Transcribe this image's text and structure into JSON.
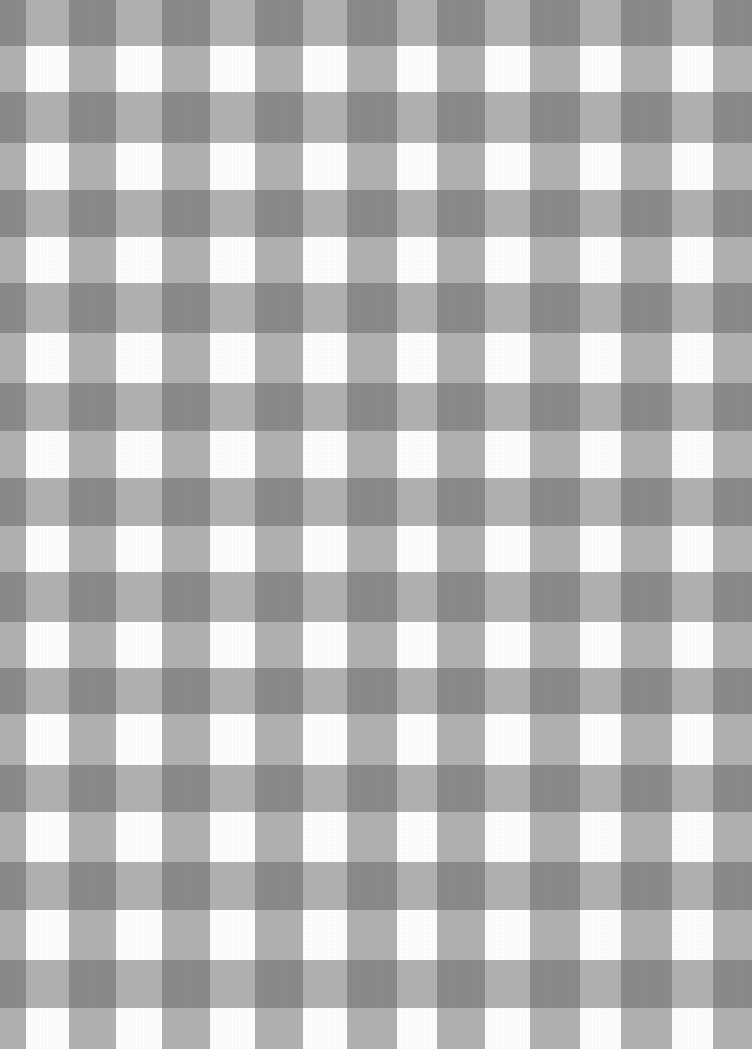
{
  "image": {
    "subject": "Gray watercolor gingham check pattern",
    "width": 752,
    "height": 1049,
    "colors": {
      "background_white": "#fdfdfd",
      "band_tint": "#b3b3b3",
      "intersection": "#8a8a8a"
    },
    "vertical_bands": [
      {
        "x": 0,
        "w": 26
      },
      {
        "x": 69,
        "w": 47
      },
      {
        "x": 162,
        "w": 48
      },
      {
        "x": 255,
        "w": 48
      },
      {
        "x": 347,
        "w": 50
      },
      {
        "x": 437,
        "w": 48
      },
      {
        "x": 530,
        "w": 50
      },
      {
        "x": 621,
        "w": 51
      },
      {
        "x": 713,
        "w": 39
      }
    ],
    "horizontal_bands": [
      {
        "y": 0,
        "h": 46
      },
      {
        "y": 92,
        "h": 51
      },
      {
        "y": 190,
        "h": 47
      },
      {
        "y": 283,
        "h": 50
      },
      {
        "y": 383,
        "h": 48
      },
      {
        "y": 478,
        "h": 48
      },
      {
        "y": 572,
        "h": 50
      },
      {
        "y": 668,
        "h": 46
      },
      {
        "y": 765,
        "h": 47
      },
      {
        "y": 862,
        "h": 48
      },
      {
        "y": 960,
        "h": 48
      }
    ]
  }
}
